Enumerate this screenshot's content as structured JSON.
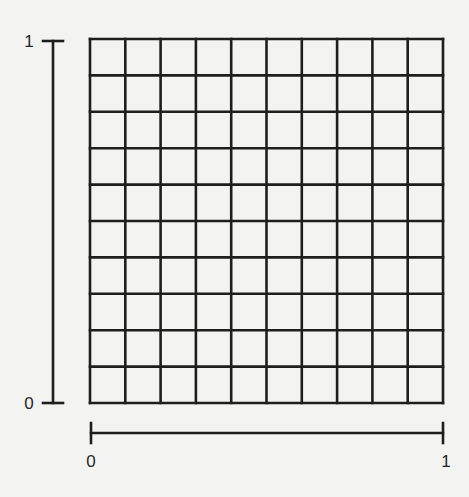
{
  "diagram": {
    "title": "",
    "grid": {
      "rows": 10,
      "cols": 10,
      "left": 90,
      "top": 39,
      "right": 443,
      "bottom": 403,
      "line_color": "#1e1e1e",
      "line_width": 2.6
    },
    "vertical_axis": {
      "x": 53,
      "top": 41,
      "bottom": 403,
      "tick_half_width": 10,
      "min_label": "0",
      "max_label": "1",
      "label_x": 29
    },
    "horizontal_axis": {
      "y": 433,
      "left": 91,
      "right": 443,
      "tick_half_height": 10,
      "min_label": "0",
      "max_label": "1",
      "label_y": 461
    },
    "colors": {
      "background": "#f3f3f2",
      "ink": "#1e1e1e"
    }
  }
}
